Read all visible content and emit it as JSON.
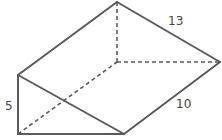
{
  "figure": {
    "type": "triangular-prism",
    "stroke_color": "#5a5a5a",
    "background": "#ffffff",
    "vertices": {
      "apex_top": [
        117,
        2
      ],
      "back_bottom": [
        117,
        62
      ],
      "right": [
        220,
        62
      ],
      "front_top_left": [
        18,
        75
      ],
      "front_bottom_left": [
        18,
        134
      ],
      "front_bottom_right": [
        124,
        134
      ]
    },
    "labels": {
      "top_edge": "13",
      "right_edge": "10",
      "left_edge": "5"
    }
  }
}
